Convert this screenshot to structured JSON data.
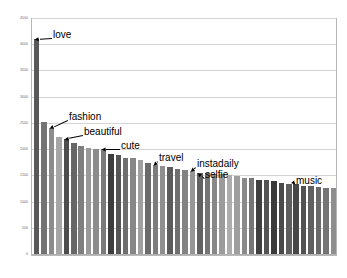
{
  "chart_data": {
    "type": "bar",
    "title": "",
    "subtitle": "",
    "xlabel": "",
    "ylabel": "",
    "ylim": [
      0,
      4500
    ],
    "xlim_categories_count": 41,
    "grid": true,
    "gridlines_axis": "y",
    "legend": "none",
    "legend_position": "none",
    "orientation": "vertical",
    "sorted": "descending",
    "yticks": [
      0,
      500,
      1000,
      1500,
      2000,
      2500,
      3000,
      3500,
      4000,
      4500
    ],
    "ytick_labels": [
      "0",
      "500",
      "1000",
      "1500",
      "2000",
      "2500",
      "3000",
      "3500",
      "4000",
      "4500"
    ],
    "xtick_labels": [],
    "categories": [
      "bar-1",
      "bar-2",
      "bar-3",
      "bar-4",
      "bar-5",
      "bar-6",
      "bar-7",
      "bar-8",
      "bar-9",
      "bar-10",
      "bar-11",
      "bar-12",
      "bar-13",
      "bar-14",
      "bar-15",
      "bar-16",
      "bar-17",
      "bar-18",
      "bar-19",
      "bar-20",
      "bar-21",
      "bar-22",
      "bar-23",
      "bar-24",
      "bar-25",
      "bar-26",
      "bar-27",
      "bar-28",
      "bar-29",
      "bar-30",
      "bar-31",
      "bar-32",
      "bar-33",
      "bar-34",
      "bar-35",
      "bar-36",
      "bar-37",
      "bar-38",
      "bar-39",
      "bar-40",
      "bar-41"
    ],
    "values": [
      4100,
      2510,
      2400,
      2230,
      2200,
      2120,
      2060,
      2030,
      2010,
      2000,
      1910,
      1880,
      1840,
      1830,
      1790,
      1730,
      1700,
      1680,
      1650,
      1620,
      1610,
      1590,
      1540,
      1540,
      1530,
      1520,
      1500,
      1480,
      1450,
      1440,
      1420,
      1410,
      1390,
      1360,
      1340,
      1330,
      1300,
      1290,
      1270,
      1260,
      1250
    ],
    "bar_colors": [
      "#595959",
      "#737373",
      "#8c8c8c",
      "#a6a6a6",
      "#4d4d4d",
      "#666666",
      "#7f7f7f",
      "#999999",
      "#8c8c8c",
      "#7a7a7a",
      "#3d3d3d",
      "#555555",
      "#6e6e6e",
      "#878787",
      "#a0a0a0",
      "#6b6b6b",
      "#7d7d7d",
      "#8f8f8f",
      "#5c5c5c",
      "#707070",
      "#838383",
      "#969696",
      "#626262",
      "#757575",
      "#888888",
      "#9b9b9b",
      "#adadad",
      "#9e9e9e",
      "#8a8a8a",
      "#767676",
      "#404040",
      "#535353",
      "#3a3a3a",
      "#4a4a4a",
      "#5e5e5e",
      "#474747",
      "#525252",
      "#606060",
      "#6a6a6a",
      "#757575",
      "#8e8e8e"
    ],
    "annotations": [
      {
        "text": "love",
        "bar_index": 0,
        "label_x": 53,
        "label_y": 30
      },
      {
        "text": "fashion",
        "bar_index": 2,
        "label_x": 69,
        "label_y": 112
      },
      {
        "text": "beautiful",
        "bar_index": 4,
        "label_x": 84,
        "label_y": 127
      },
      {
        "text": "cute",
        "bar_index": 9,
        "label_x": 121,
        "label_y": 141
      },
      {
        "text": "travel",
        "bar_index": 16,
        "label_x": 159,
        "label_y": 153
      },
      {
        "text": "instadaily",
        "bar_index": 21,
        "label_x": 197,
        "label_y": 159
      },
      {
        "text": "selfie",
        "bar_index": 22,
        "label_x": 205,
        "label_y": 170
      },
      {
        "text": "music",
        "bar_index": 35,
        "label_x": 296,
        "label_y": 176
      }
    ],
    "colors": {
      "background": "#ffffff",
      "plot_border": "#b8b8b8",
      "gridline": "#d4d4d4",
      "axis_text": "#6b6b6b",
      "annotation_text": "#000000",
      "leader_line": "#000000"
    }
  }
}
